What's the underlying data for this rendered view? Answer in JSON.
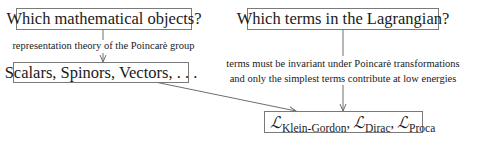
{
  "diagram": {
    "boxes": {
      "math_objects_question": "Which mathematical objects?",
      "lagrangian_question": "Which terms in the Lagrangian?",
      "field_types": "Scalars, Spinors, Vectors, . . .",
      "lagrangians": {
        "symbol": "ℒ",
        "terms": [
          {
            "sub": "Klein-Gordon",
            "sep": ","
          },
          {
            "sub": "Dirac",
            "sep": ","
          },
          {
            "sub": "Proca",
            "sep": ""
          }
        ]
      }
    },
    "edge_labels": {
      "representation_theory": "representation theory of the Poincarè group",
      "invariance_line1": "terms must be invariant under Poincarè transformations",
      "invariance_line2": "and only the simplest terms contribute at low energies"
    },
    "colors": {
      "line": "#6e6e6e",
      "border": "#7a7a7a",
      "text": "#1a1a1a"
    }
  }
}
